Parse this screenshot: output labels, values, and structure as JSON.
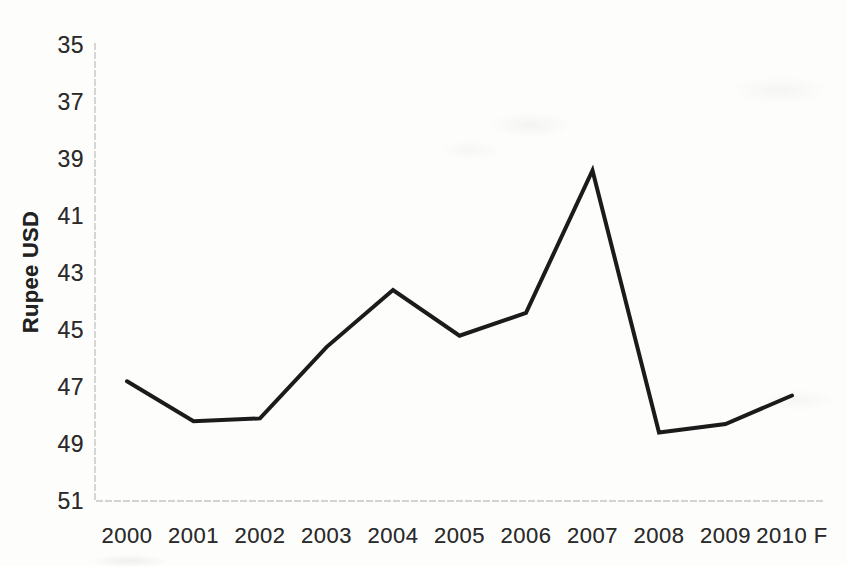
{
  "page": {
    "background_color": "#fdfdfc",
    "text_color": "#2b2b2b"
  },
  "chart_data": {
    "type": "line",
    "title": "",
    "xlabel": "",
    "ylabel": "Rupee USD",
    "categories": [
      "2000",
      "2001",
      "2002",
      "2003",
      "2004",
      "2005",
      "2006",
      "2007",
      "2008",
      "2009",
      "2010 F"
    ],
    "series": [
      {
        "name": "Rupee per USD exchange rate",
        "values": [
          46.8,
          48.2,
          48.1,
          45.6,
          43.6,
          45.2,
          44.4,
          39.4,
          48.6,
          48.3,
          47.3
        ]
      }
    ],
    "y_ticks": [
      35,
      37,
      39,
      41,
      43,
      45,
      47,
      49,
      51
    ],
    "y_axis_inverted": true,
    "ylim": [
      35,
      51
    ],
    "grid": false,
    "legend": "none",
    "line_color": "#1b1b1b",
    "line_width": 4,
    "axis_color": "#c5c5c5"
  }
}
